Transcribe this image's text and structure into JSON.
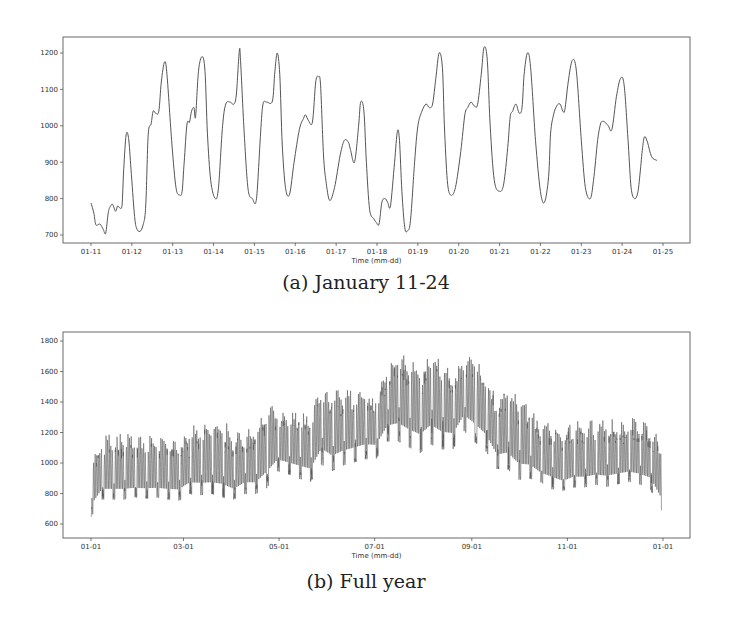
{
  "captions": {
    "a": "(a) January 11-24",
    "b": "(b) Full year"
  },
  "colors": {
    "line": "#555555",
    "frame": "#444444",
    "text": "#333333"
  },
  "chart_data": [
    {
      "id": "a",
      "type": "line",
      "title": "(a) January 11-24",
      "xlabel": "Time (mm-dd)",
      "ylabel": "",
      "ylim": [
        680,
        1240
      ],
      "yticks": [
        700,
        800,
        900,
        1000,
        1100,
        1200
      ],
      "xticks": [
        "01-11",
        "01-12",
        "01-13",
        "01-14",
        "01-15",
        "01-16",
        "01-17",
        "01-18",
        "01-19",
        "01-20",
        "01-21",
        "01-22",
        "01-23",
        "01-24",
        "01-25"
      ],
      "grid": false,
      "x_unit": "days since 01-11",
      "x": [
        0.0,
        0.07,
        0.12,
        0.22,
        0.3,
        0.36,
        0.42,
        0.47,
        0.53,
        0.6,
        0.65,
        0.7,
        0.76,
        0.8,
        0.86,
        0.92,
        0.98,
        1.06,
        1.11,
        1.2,
        1.28,
        1.34,
        1.4,
        1.47,
        1.52,
        1.58,
        1.66,
        1.72,
        1.8,
        1.86,
        1.98,
        2.08,
        2.17,
        2.23,
        2.28,
        2.35,
        2.41,
        2.46,
        2.52,
        2.56,
        2.63,
        2.72,
        2.79,
        2.85,
        2.93,
        3.04,
        3.12,
        3.22,
        3.3,
        3.4,
        3.5,
        3.56,
        3.63,
        3.66,
        3.74,
        3.84,
        3.95,
        4.05,
        4.15,
        4.21,
        4.3,
        4.44,
        4.5,
        4.56,
        4.62,
        4.68,
        4.76,
        4.86,
        4.97,
        5.1,
        5.2,
        5.25,
        5.32,
        5.42,
        5.5,
        5.57,
        5.62,
        5.69,
        5.75,
        5.84,
        5.96,
        6.1,
        6.2,
        6.3,
        6.35,
        6.45,
        6.55,
        6.6,
        6.68,
        6.74,
        6.82,
        6.92,
        6.98,
        7.05,
        7.12,
        7.2,
        7.26,
        7.33,
        7.43,
        7.5,
        7.55,
        7.61,
        7.68,
        7.75,
        7.82,
        7.92,
        8.0,
        8.1,
        8.2,
        8.28,
        8.36,
        8.44,
        8.52,
        8.6,
        8.65,
        8.72,
        8.8,
        8.92,
        9.05,
        9.15,
        9.22,
        9.3,
        9.38,
        9.46,
        9.55,
        9.62,
        9.7,
        9.77,
        9.87,
        10.0,
        10.1,
        10.2,
        10.26,
        10.32,
        10.4,
        10.48,
        10.55,
        10.6,
        10.68,
        10.76,
        10.88,
        11.0,
        11.1,
        11.2,
        11.25,
        11.32,
        11.4,
        11.48,
        11.55,
        11.6,
        11.68,
        11.78,
        11.88,
        12.0,
        12.1,
        12.22,
        12.3,
        12.4,
        12.47,
        12.52,
        12.58,
        12.66,
        12.75,
        12.86,
        12.96,
        13.05,
        13.15,
        13.22,
        13.3,
        13.38,
        13.44,
        13.5,
        13.55,
        13.62,
        13.72,
        13.85
      ],
      "values": [
        788,
        760,
        728,
        730,
        715,
        705,
        760,
        778,
        784,
        765,
        780,
        775,
        783,
        880,
        975,
        965,
        880,
        760,
        720,
        710,
        730,
        780,
        975,
        1005,
        1040,
        1035,
        1040,
        1120,
        1175,
        1140,
        950,
        830,
        810,
        820,
        900,
        1005,
        1010,
        1040,
        1050,
        1025,
        1150,
        1190,
        1150,
        980,
        850,
        800,
        830,
        1000,
        1060,
        1065,
        1060,
        1090,
        1205,
        1180,
        1000,
        830,
        800,
        800,
        980,
        1060,
        1065,
        1068,
        1150,
        1200,
        1140,
        950,
        830,
        812,
        900,
        990,
        1020,
        1030,
        1015,
        1010,
        1120,
        1135,
        1110,
        920,
        850,
        795,
        830,
        920,
        960,
        955,
        935,
        900,
        1000,
        1065,
        1040,
        900,
        770,
        745,
        735,
        730,
        790,
        800,
        790,
        780,
        900,
        985,
        960,
        820,
        720,
        712,
        740,
        900,
        1000,
        1040,
        1060,
        1050,
        1060,
        1130,
        1200,
        1160,
        1000,
        850,
        810,
        830,
        930,
        1030,
        1050,
        1065,
        1055,
        1058,
        1140,
        1215,
        1180,
        1000,
        850,
        820,
        840,
        940,
        1025,
        1040,
        1060,
        1035,
        1050,
        1140,
        1200,
        1160,
        960,
        820,
        790,
        860,
        980,
        1030,
        1055,
        1060,
        1040,
        1045,
        1120,
        1180,
        1150,
        960,
        830,
        800,
        850,
        960,
        1005,
        1012,
        1010,
        1000,
        990,
        1080,
        1130,
        1110,
        950,
        830,
        800,
        815,
        870,
        940,
        970,
        955,
        915,
        905,
        1020,
        1065,
        1000,
        860
      ]
    },
    {
      "id": "b",
      "type": "line",
      "title": "(b) Full year",
      "xlabel": "Time (mm-dd)",
      "ylabel": "",
      "ylim": [
        520,
        1860
      ],
      "yticks": [
        600,
        800,
        1000,
        1200,
        1400,
        1600,
        1800
      ],
      "xticks": [
        "01-01",
        "03-01",
        "05-01",
        "07-01",
        "09-01",
        "11-01",
        "01-01"
      ],
      "xtick_positions_days": [
        0,
        59,
        120,
        181,
        243,
        304,
        365
      ],
      "grid": false,
      "x_unit": "week of year",
      "series_summary": "weekly envelope of hourly load",
      "weeks": [
        0,
        1,
        2,
        3,
        4,
        5,
        6,
        7,
        8,
        9,
        10,
        11,
        12,
        13,
        14,
        15,
        16,
        17,
        18,
        19,
        20,
        21,
        22,
        23,
        24,
        25,
        26,
        27,
        28,
        29,
        30,
        31,
        32,
        33,
        34,
        35,
        36,
        37,
        38,
        39,
        40,
        41,
        42,
        43,
        44,
        45,
        46,
        47,
        48,
        49,
        50,
        51,
        52
      ],
      "weekly_max": [
        1030,
        1190,
        1200,
        1210,
        1200,
        1190,
        1200,
        1180,
        1170,
        1240,
        1270,
        1300,
        1300,
        1200,
        1250,
        1250,
        1390,
        1380,
        1340,
        1360,
        1320,
        1520,
        1480,
        1500,
        1490,
        1480,
        1460,
        1680,
        1740,
        1700,
        1640,
        1780,
        1680,
        1620,
        1720,
        1720,
        1600,
        1460,
        1540,
        1450,
        1400,
        1280,
        1280,
        1220,
        1280,
        1280,
        1280,
        1280,
        1300,
        1300,
        1300,
        1260,
        1130
      ],
      "weekly_min": [
        580,
        700,
        700,
        700,
        720,
        710,
        720,
        700,
        690,
        730,
        720,
        730,
        700,
        700,
        730,
        730,
        740,
        880,
        860,
        820,
        800,
        900,
        860,
        900,
        920,
        940,
        950,
        1050,
        1040,
        1000,
        960,
        1010,
        990,
        1000,
        1120,
        1030,
        980,
        880,
        860,
        800,
        820,
        820,
        760,
        760,
        780,
        780,
        800,
        780,
        800,
        820,
        800,
        760,
        600
      ],
      "weekly_base": [
        800,
        900,
        900,
        900,
        900,
        900,
        900,
        900,
        900,
        950,
        950,
        950,
        950,
        900,
        950,
        950,
        1050,
        1100,
        1080,
        1070,
        1050,
        1200,
        1150,
        1180,
        1200,
        1220,
        1210,
        1350,
        1380,
        1340,
        1310,
        1380,
        1320,
        1300,
        1420,
        1380,
        1300,
        1150,
        1180,
        1100,
        1080,
        1000,
        990,
        950,
        980,
        980,
        990,
        990,
        1000,
        1010,
        1000,
        980,
        860
      ]
    }
  ]
}
